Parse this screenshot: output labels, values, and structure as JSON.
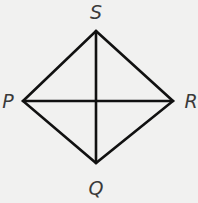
{
  "diagram": {
    "type": "rhombus-with-diagonals",
    "background": "#f1f1f0",
    "line_color": "#111111",
    "label_color": "#3a3a3a",
    "vertices": {
      "S": {
        "label": "S",
        "x": 96,
        "y": 31,
        "label_x": 96,
        "label_y": 19
      },
      "P": {
        "label": "P",
        "x": 23,
        "y": 101,
        "label_x": 8,
        "label_y": 108
      },
      "R": {
        "label": "R",
        "x": 173,
        "y": 101,
        "label_x": 191,
        "label_y": 108
      },
      "Q": {
        "label": "Q",
        "x": 96,
        "y": 163,
        "label_x": 96,
        "label_y": 195
      }
    },
    "edges": [
      [
        "S",
        "R"
      ],
      [
        "R",
        "Q"
      ],
      [
        "Q",
        "P"
      ],
      [
        "P",
        "S"
      ]
    ],
    "diagonals": [
      [
        "S",
        "Q"
      ],
      [
        "P",
        "R"
      ]
    ]
  }
}
